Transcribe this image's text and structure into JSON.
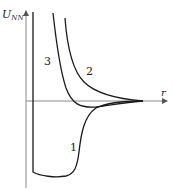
{
  "figure": {
    "y_axis_label": "U",
    "y_axis_label_sub": "NN",
    "x_axis_label": "r",
    "curves": [
      {
        "id": "1",
        "label": "1",
        "description": "deep potential well with hard-core wall"
      },
      {
        "id": "2",
        "label": "2",
        "description": "purely repulsive potential"
      },
      {
        "id": "3",
        "label": "3",
        "description": "repulsive core with shallow attractive well"
      }
    ],
    "colors": {
      "curve": "#1a1a1a",
      "axis": "#8a8a8a",
      "background": "#ffffff"
    }
  }
}
